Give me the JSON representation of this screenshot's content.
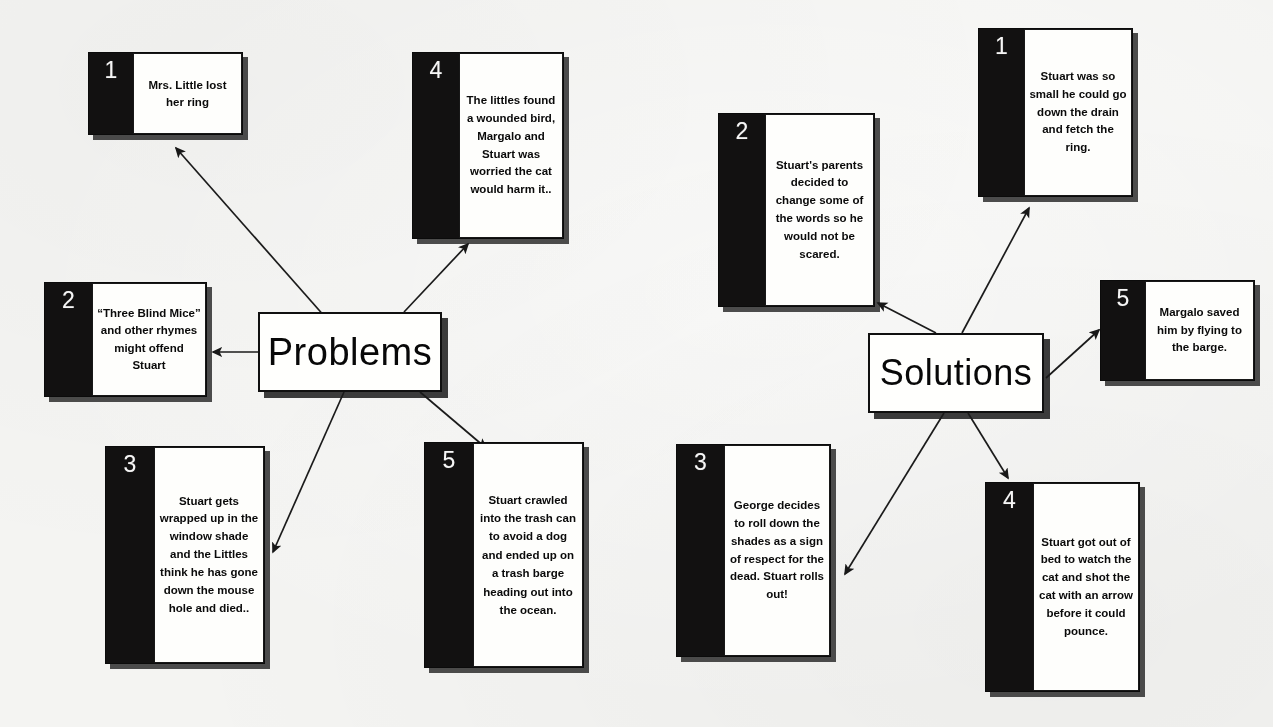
{
  "document": {
    "title": "Stuart Little - Problems and Solutions Graphic Organizer",
    "background_color": "#f2f2f0",
    "ink_color": "#111010"
  },
  "problems": {
    "hub": {
      "label": "Problems",
      "x": 258,
      "y": 312,
      "w": 184,
      "h": 80,
      "font_size": 38
    },
    "cards": [
      {
        "number": "1",
        "text": "Mrs. Little lost her ring",
        "x": 88,
        "y": 52,
        "w": 155,
        "h": 83,
        "num_w": 44,
        "font_size": 11.5,
        "line_height": 1.45
      },
      {
        "number": "2",
        "text": "“Three Blind Mice” and other rhymes might offend Stuart",
        "x": 44,
        "y": 282,
        "w": 163,
        "h": 115,
        "num_w": 47,
        "font_size": 11.5,
        "line_height": 1.5
      },
      {
        "number": "3",
        "text": "Stuart gets wrapped up in the window shade and the Littles think he has gone down the mouse hole and died..",
        "x": 105,
        "y": 446,
        "w": 160,
        "h": 218,
        "num_w": 48,
        "font_size": 11.5,
        "line_height": 1.55
      },
      {
        "number": "4",
        "text": "The littles found a wounded bird, Margalo and Stuart was worried the cat would harm it..",
        "x": 412,
        "y": 52,
        "w": 152,
        "h": 187,
        "num_w": 46,
        "font_size": 11.5,
        "line_height": 1.55
      },
      {
        "number": "5",
        "text": "Stuart crawled into the trash can to avoid a dog and ended up on a trash barge heading out into the ocean.",
        "x": 424,
        "y": 442,
        "w": 160,
        "h": 226,
        "num_w": 48,
        "font_size": 11.5,
        "line_height": 1.6
      }
    ]
  },
  "solutions": {
    "hub": {
      "label": "Solutions",
      "x": 868,
      "y": 333,
      "w": 176,
      "h": 80,
      "font_size": 36
    },
    "cards": [
      {
        "number": "1",
        "text": "Stuart was so small he could go down the drain and fetch the ring.",
        "x": 978,
        "y": 28,
        "w": 155,
        "h": 169,
        "num_w": 45,
        "font_size": 11.5,
        "line_height": 1.55
      },
      {
        "number": "2",
        "text": "Stuart's parents decided to change some of the words so he would not be scared.",
        "x": 718,
        "y": 113,
        "w": 157,
        "h": 194,
        "num_w": 46,
        "font_size": 11.5,
        "line_height": 1.55
      },
      {
        "number": "3",
        "text": "George decides to roll down the shades as a sign of respect for the dead. Stuart rolls out!",
        "x": 676,
        "y": 444,
        "w": 155,
        "h": 213,
        "num_w": 47,
        "font_size": 11.5,
        "line_height": 1.55
      },
      {
        "number": "4",
        "text": "Stuart got out of bed to watch the cat and shot the cat with an arrow before it could pounce.",
        "x": 985,
        "y": 482,
        "w": 155,
        "h": 210,
        "num_w": 47,
        "font_size": 11.5,
        "line_height": 1.55
      },
      {
        "number": "5",
        "text": "Margalo saved him by flying to the barge.",
        "x": 1100,
        "y": 280,
        "w": 155,
        "h": 101,
        "num_w": 44,
        "font_size": 11.5,
        "line_height": 1.55
      }
    ]
  },
  "connectors": [
    {
      "name": "problems-to-1",
      "from": [
        326,
        318
      ],
      "to": [
        176,
        148
      ]
    },
    {
      "name": "problems-to-2",
      "from": [
        258,
        352
      ],
      "to": [
        213,
        352
      ]
    },
    {
      "name": "problems-to-3",
      "from": [
        344,
        392
      ],
      "to": [
        273,
        552
      ]
    },
    {
      "name": "problems-to-4",
      "from": [
        404,
        312
      ],
      "to": [
        468,
        244
      ]
    },
    {
      "name": "problems-to-5",
      "from": [
        420,
        392
      ],
      "to": [
        486,
        448
      ]
    },
    {
      "name": "solutions-to-1",
      "from": [
        962,
        333
      ],
      "to": [
        1029,
        208
      ]
    },
    {
      "name": "solutions-to-2",
      "from": [
        936,
        333
      ],
      "to": [
        878,
        303
      ]
    },
    {
      "name": "solutions-to-3",
      "from": [
        944,
        413
      ],
      "to": [
        845,
        574
      ]
    },
    {
      "name": "solutions-to-4",
      "from": [
        968,
        413
      ],
      "to": [
        1008,
        478
      ]
    },
    {
      "name": "solutions-to-5",
      "from": [
        1046,
        378
      ],
      "to": [
        1099,
        330
      ]
    }
  ]
}
